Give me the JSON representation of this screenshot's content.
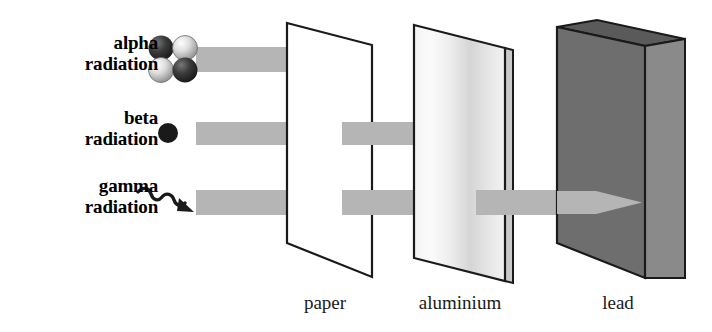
{
  "diagram": {
    "background_color": "#ffffff",
    "sources": [
      {
        "id": "alpha",
        "label_line1": "alpha",
        "label_line2": "radiation",
        "icon": "alpha-particle-cluster-icon",
        "beam_color": "#b5b5b5",
        "stopped_by": "paper"
      },
      {
        "id": "beta",
        "label_line1": "beta",
        "label_line2": "radiation",
        "icon": "beta-particle-dot-icon",
        "beam_color": "#b5b5b5",
        "stopped_by": "aluminium"
      },
      {
        "id": "gamma",
        "label_line1": "gamma",
        "label_line2": "radiation",
        "icon": "gamma-ray-wave-arrow-icon",
        "beam_color": "#b5b5b5",
        "stopped_by": "lead"
      }
    ],
    "barriers": [
      {
        "id": "paper",
        "label": "paper",
        "fill": "#ffffff",
        "outline": "#1a1a1a"
      },
      {
        "id": "aluminium",
        "label": "aluminium",
        "fill": "#e8e8e8",
        "outline": "#1a1a1a"
      },
      {
        "id": "lead",
        "label": "lead",
        "front_fill": "#6e6e6e",
        "side_fill": "#8a8a8a",
        "top_fill": "#5a5a5a",
        "outline": "#1a1a1a"
      }
    ],
    "colors": {
      "beam": "#b5b5b5",
      "outline": "#1a1a1a",
      "text": "#000000",
      "lead_front": "#6e6e6e",
      "lead_side": "#8a8a8a",
      "lead_top": "#5a5a5a"
    }
  }
}
